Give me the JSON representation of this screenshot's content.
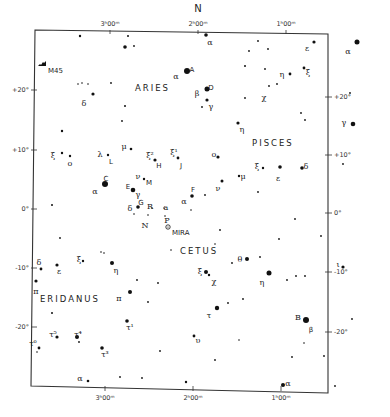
{
  "chart_data": {
    "type": "star-chart",
    "title": "",
    "orientation_label": "N",
    "frame": {
      "left": 35,
      "top": 32,
      "right": 328,
      "bottom": 391
    },
    "ra_ticks": [
      {
        "label": "3ʰ00ᵐ",
        "x_top": 110,
        "x_bottom": 105
      },
      {
        "label": "2ʰ00ᵐ",
        "x_top": 198,
        "x_bottom": 193
      },
      {
        "label": "1ʰ00ᵐ",
        "x_top": 286,
        "x_bottom": 281
      }
    ],
    "dec_ticks": [
      {
        "label": "+20°",
        "y_left": 90,
        "y_right": 97
      },
      {
        "label": "+10°",
        "y_left": 150,
        "y_right": 155
      },
      {
        "label": "0°",
        "y_left": 209,
        "y_right": 213
      },
      {
        "label": "-10°",
        "y_left": 268,
        "y_right": 272
      },
      {
        "label": "-20°",
        "y_left": 327,
        "y_right": 332
      }
    ],
    "constellations": [
      {
        "name": "ARIES",
        "x": 135,
        "y": 91
      },
      {
        "name": "PISCES",
        "x": 252,
        "y": 146
      },
      {
        "name": "CETUS",
        "x": 180,
        "y": 254
      },
      {
        "name": "ERIDANUS",
        "x": 40,
        "y": 302
      }
    ],
    "objects": [
      {
        "name": "M45",
        "type": "cluster",
        "x": 42,
        "y": 64,
        "label": "M45"
      },
      {
        "name": "Mira",
        "type": "variable",
        "x": 168,
        "y": 227,
        "label": "MIRA"
      }
    ],
    "stars": [
      {
        "x": 80,
        "y": 36,
        "r": 1.2
      },
      {
        "x": 128,
        "y": 36,
        "r": 1
      },
      {
        "x": 125,
        "y": 47,
        "r": 1.8
      },
      {
        "x": 134,
        "y": 46,
        "r": 0.9
      },
      {
        "x": 78,
        "y": 84,
        "r": 0.8
      },
      {
        "x": 82,
        "y": 83,
        "r": 0.8
      },
      {
        "x": 88,
        "y": 84,
        "r": 0.8
      },
      {
        "x": 111,
        "y": 83,
        "r": 0.9
      },
      {
        "x": 93,
        "y": 94,
        "r": 1.6,
        "label": "δ",
        "lx": 84,
        "ly": 103
      },
      {
        "x": 125,
        "y": 106,
        "r": 1
      },
      {
        "x": 122,
        "y": 121,
        "r": 0.9
      },
      {
        "x": 62,
        "y": 131,
        "r": 1.2
      },
      {
        "x": 187,
        "y": 71,
        "r": 3,
        "label": "α",
        "lx": 176,
        "ly": 76,
        "label2": "A",
        "l2x": 192,
        "l2y": 69
      },
      {
        "x": 206,
        "y": 35,
        "r": 1.8,
        "label": "α",
        "lx": 210,
        "ly": 42
      },
      {
        "x": 207,
        "y": 89,
        "r": 2.5,
        "label": "β",
        "lx": 197,
        "ly": 93,
        "label2": "D",
        "l2x": 211,
        "l2y": 87
      },
      {
        "x": 207,
        "y": 100,
        "r": 1.6,
        "label": "γ",
        "lx": 211,
        "ly": 106
      },
      {
        "x": 202,
        "y": 107,
        "r": 0.9
      },
      {
        "x": 245,
        "y": 66,
        "r": 1
      },
      {
        "x": 249,
        "y": 51,
        "r": 0.9
      },
      {
        "x": 258,
        "y": 41,
        "r": 0.9
      },
      {
        "x": 268,
        "y": 49,
        "r": 0.9
      },
      {
        "x": 314,
        "y": 42,
        "r": 1.6,
        "label": "ε",
        "lx": 307,
        "ly": 48
      },
      {
        "x": 357,
        "y": 42,
        "r": 2.5,
        "label": "α",
        "lx": 348,
        "ly": 51
      },
      {
        "x": 265,
        "y": 69,
        "r": 0.9
      },
      {
        "x": 290,
        "y": 74,
        "r": 1.4,
        "label": "η",
        "lx": 282,
        "ly": 74
      },
      {
        "x": 304,
        "y": 68,
        "r": 1.4,
        "label": "ξ",
        "lx": 308,
        "ly": 72
      },
      {
        "x": 269,
        "y": 86,
        "r": 0.9,
        "label": "χ",
        "lx": 264,
        "ly": 97
      },
      {
        "x": 277,
        "y": 84,
        "r": 0.9
      },
      {
        "x": 245,
        "y": 98,
        "r": 0.9
      },
      {
        "x": 350,
        "y": 93,
        "r": 0.9
      },
      {
        "x": 353,
        "y": 124,
        "r": 2.3,
        "label": "γ",
        "lx": 344,
        "ly": 122
      },
      {
        "x": 301,
        "y": 113,
        "r": 0.9
      },
      {
        "x": 305,
        "y": 120,
        "r": 0.9
      },
      {
        "x": 238,
        "y": 123,
        "r": 1.6,
        "label": "η",
        "lx": 242,
        "ly": 129
      },
      {
        "x": 62,
        "y": 153,
        "r": 1.2,
        "label": "ξ",
        "lx": 53,
        "ly": 155
      },
      {
        "x": 70,
        "y": 156,
        "r": 1.2,
        "label": "ο",
        "lx": 70,
        "ly": 163
      },
      {
        "x": 108,
        "y": 155,
        "r": 1.2,
        "label": "λ",
        "lx": 100,
        "ly": 154,
        "label2": "L",
        "l2x": 111,
        "l2y": 161
      },
      {
        "x": 131,
        "y": 149,
        "r": 1.3,
        "label": "μ",
        "lx": 124,
        "ly": 146
      },
      {
        "x": 155,
        "y": 160,
        "r": 1.6,
        "label": "ξ²",
        "lx": 150,
        "ly": 155,
        "label2": "H",
        "l2x": 159,
        "l2y": 165
      },
      {
        "x": 178,
        "y": 158,
        "r": 1.4,
        "label": "ξ¹",
        "lx": 174,
        "ly": 152,
        "label2": "J",
        "l2x": 181,
        "l2y": 165
      },
      {
        "x": 218,
        "y": 157,
        "r": 1.6,
        "label": "ο",
        "lx": 214,
        "ly": 154
      },
      {
        "x": 144,
        "y": 179,
        "r": 1.2,
        "label": "ν",
        "lx": 138,
        "ly": 176,
        "label2": "M",
        "l2x": 149,
        "l2y": 182
      },
      {
        "x": 105,
        "y": 184,
        "r": 3,
        "label": "α",
        "lx": 95,
        "ly": 191,
        "label2": "C",
        "l2x": 106,
        "l2y": 178
      },
      {
        "x": 133,
        "y": 190,
        "r": 2.3,
        "label": "γ",
        "lx": 138,
        "ly": 194,
        "label2": "E",
        "l2x": 128,
        "l2y": 186
      },
      {
        "x": 138,
        "y": 207,
        "r": 1.8,
        "label": "δ",
        "lx": 130,
        "ly": 208,
        "label2": "G",
        "l2x": 141,
        "l2y": 202
      },
      {
        "x": 134,
        "y": 214,
        "r": 0.8
      },
      {
        "x": 152,
        "y": 208,
        "r": 0.8,
        "label": "R",
        "lx": 150,
        "ly": 206
      },
      {
        "x": 148,
        "y": 215,
        "r": 0.8,
        "label": "N",
        "lx": 145,
        "ly": 225
      },
      {
        "x": 164,
        "y": 208,
        "r": 0.8,
        "label": "a",
        "lx": 166,
        "ly": 207
      },
      {
        "x": 165,
        "y": 216,
        "r": 0.8,
        "label": "P",
        "lx": 167,
        "ly": 220
      },
      {
        "x": 192,
        "y": 196,
        "r": 1.8,
        "label": "α",
        "lx": 184,
        "ly": 201,
        "label2": "F",
        "l2x": 193,
        "l2y": 189
      },
      {
        "x": 205,
        "y": 195,
        "r": 0.9
      },
      {
        "x": 191,
        "y": 210,
        "r": 0.8
      },
      {
        "x": 222,
        "y": 181,
        "r": 1.5,
        "label": "ν",
        "lx": 218,
        "ly": 188
      },
      {
        "x": 239,
        "y": 176,
        "r": 1.2,
        "label": "μ",
        "lx": 243,
        "ly": 176
      },
      {
        "x": 263,
        "y": 168,
        "r": 1.2,
        "label": "ξ",
        "lx": 257,
        "ly": 166
      },
      {
        "x": 280,
        "y": 167,
        "r": 1.8,
        "label": "ε",
        "lx": 278,
        "ly": 178
      },
      {
        "x": 302,
        "y": 168,
        "r": 1.8,
        "label": "δ",
        "lx": 306,
        "ly": 166
      },
      {
        "x": 343,
        "y": 164,
        "r": 0.9
      },
      {
        "x": 258,
        "y": 192,
        "r": 0.9
      },
      {
        "x": 295,
        "y": 219,
        "r": 0.9
      },
      {
        "x": 220,
        "y": 230,
        "r": 0.9
      },
      {
        "x": 279,
        "y": 239,
        "r": 0.9
      },
      {
        "x": 321,
        "y": 236,
        "r": 0.9
      },
      {
        "x": 215,
        "y": 244,
        "r": 0.8
      },
      {
        "x": 52,
        "y": 205,
        "r": 1
      },
      {
        "x": 60,
        "y": 238,
        "r": 0.9
      },
      {
        "x": 171,
        "y": 250,
        "r": 0.8
      },
      {
        "x": 247,
        "y": 259,
        "r": 2,
        "label": "θ",
        "lx": 240,
        "ly": 259
      },
      {
        "x": 260,
        "y": 257,
        "r": 0.9
      },
      {
        "x": 232,
        "y": 263,
        "r": 0.9
      },
      {
        "x": 206,
        "y": 272,
        "r": 2,
        "label": "ξ",
        "lx": 200,
        "ly": 271
      },
      {
        "x": 209,
        "y": 275,
        "r": 1.2,
        "label": "χ",
        "lx": 214,
        "ly": 281
      },
      {
        "x": 269,
        "y": 273,
        "r": 2.5,
        "label": "η",
        "lx": 262,
        "ly": 282
      },
      {
        "x": 287,
        "y": 280,
        "r": 0.9
      },
      {
        "x": 296,
        "y": 276,
        "r": 0.9
      },
      {
        "x": 305,
        "y": 276,
        "r": 0.9
      },
      {
        "x": 343,
        "y": 267,
        "r": 1.6,
        "label": "ι",
        "lx": 338,
        "ly": 264
      },
      {
        "x": 41,
        "y": 269,
        "r": 1.4,
        "label": "δ",
        "lx": 39,
        "ly": 262
      },
      {
        "x": 57,
        "y": 265,
        "r": 1.6,
        "label": "ε",
        "lx": 59,
        "ly": 271
      },
      {
        "x": 83,
        "y": 261,
        "r": 1.2,
        "label": "ξ",
        "lx": 79,
        "ly": 259
      },
      {
        "x": 101,
        "y": 252,
        "r": 0.8
      },
      {
        "x": 104,
        "y": 253,
        "r": 0.8
      },
      {
        "x": 112,
        "y": 263,
        "r": 2,
        "label": "η",
        "lx": 116,
        "ly": 270
      },
      {
        "x": 36,
        "y": 281,
        "r": 1.6,
        "label": "π",
        "lx": 36,
        "ly": 291
      },
      {
        "x": 137,
        "y": 280,
        "r": 0.9
      },
      {
        "x": 130,
        "y": 292,
        "r": 2,
        "label": "π",
        "lx": 119,
        "ly": 298
      },
      {
        "x": 148,
        "y": 302,
        "r": 0.9
      },
      {
        "x": 158,
        "y": 283,
        "r": 0.9
      },
      {
        "x": 52,
        "y": 313,
        "r": 1
      },
      {
        "x": 127,
        "y": 321,
        "r": 1.8,
        "label": "τ¹",
        "lx": 130,
        "ly": 327
      },
      {
        "x": 217,
        "y": 308,
        "r": 2.2,
        "label": "τ",
        "lx": 209,
        "ly": 315
      },
      {
        "x": 228,
        "y": 303,
        "r": 0.9
      },
      {
        "x": 243,
        "y": 299,
        "r": 0.9
      },
      {
        "x": 306,
        "y": 320,
        "r": 3,
        "label": "B",
        "lx": 298,
        "ly": 317,
        "label2": "β",
        "l2x": 311,
        "l2y": 329
      },
      {
        "x": 352,
        "y": 319,
        "r": 0.9
      },
      {
        "x": 57,
        "y": 337,
        "r": 1.6,
        "label": "τ⁵",
        "lx": 53,
        "ly": 334
      },
      {
        "x": 77,
        "y": 337,
        "r": 2,
        "label": "τ⁴",
        "lx": 78,
        "ly": 334
      },
      {
        "x": 79,
        "y": 342,
        "r": 0.9
      },
      {
        "x": 39,
        "y": 348,
        "r": 1.4,
        "label": "τ⁶",
        "lx": 33,
        "ly": 343
      },
      {
        "x": 37,
        "y": 352,
        "r": 0.8
      },
      {
        "x": 102,
        "y": 348,
        "r": 1.8,
        "label": "τ³",
        "lx": 105,
        "ly": 354
      },
      {
        "x": 160,
        "y": 351,
        "r": 0.9
      },
      {
        "x": 194,
        "y": 336,
        "r": 1.4,
        "label": "υ",
        "lx": 198,
        "ly": 340
      },
      {
        "x": 239,
        "y": 340,
        "r": 0.8
      },
      {
        "x": 304,
        "y": 343,
        "r": 0.8
      },
      {
        "x": 292,
        "y": 357,
        "r": 0.9
      },
      {
        "x": 324,
        "y": 356,
        "r": 0.9
      },
      {
        "x": 215,
        "y": 360,
        "r": 0.9
      },
      {
        "x": 88,
        "y": 381,
        "r": 1.3,
        "label": "α",
        "lx": 80,
        "ly": 378
      },
      {
        "x": 120,
        "y": 377,
        "r": 0.9
      },
      {
        "x": 142,
        "y": 378,
        "r": 0.9
      },
      {
        "x": 186,
        "y": 382,
        "r": 1.2
      },
      {
        "x": 283,
        "y": 385,
        "r": 2,
        "label": "α",
        "lx": 288,
        "ly": 383
      },
      {
        "x": 335,
        "y": 386,
        "r": 0.9
      }
    ],
    "grid": false,
    "legend": null
  }
}
